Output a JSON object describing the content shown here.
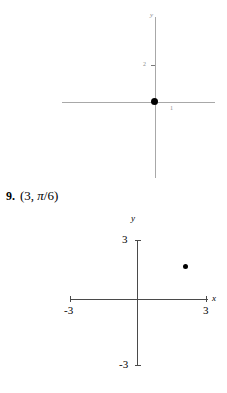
{
  "problem": {
    "number": "9.",
    "expression_open": "(",
    "radius": "3",
    "comma": ", ",
    "angle_numerator": "π",
    "angle_slash": "/",
    "angle_denominator": "6",
    "expression_close": ")",
    "full_text": "9. (3, π/6)"
  },
  "upper_graph": {
    "name": "partial-coordinate-plane",
    "y_axis_label": "y",
    "y_tick_label": "2",
    "x_tick_label": "1",
    "origin_point": {
      "label": "origin-dot",
      "x": "0",
      "y": "0"
    }
  },
  "lower_graph": {
    "name": "coordinate-plane",
    "x_axis_label": "x",
    "y_axis_label": "y",
    "ticks": {
      "y_top": "3",
      "y_bottom": "-3",
      "x_left": "-3",
      "x_right": "3"
    },
    "plotted_point": {
      "label": "plotted-point",
      "polar": "(3, π/6)",
      "x": "2.6",
      "y": "1.5"
    }
  },
  "colors": {
    "ink": "#000000",
    "axis_dark": "#4a4a4a",
    "axis_faint": "#a8a8a8",
    "label_faint": "#8d8d8d"
  },
  "chart_data": [
    {
      "type": "scatter",
      "title": "",
      "xlabel": "",
      "ylabel": "y",
      "xlim": [
        -2.5,
        2.5
      ],
      "ylim": [
        -2.5,
        4.0
      ],
      "grid": false,
      "legend": null,
      "xticks": [
        "1"
      ],
      "yticks": [
        "2"
      ],
      "x": [
        0
      ],
      "y": [
        0
      ],
      "annotations": [
        "origin dot"
      ]
    },
    {
      "type": "scatter",
      "title": "",
      "xlabel": "x",
      "ylabel": "y",
      "xlim": [
        -3,
        3
      ],
      "ylim": [
        -3,
        3
      ],
      "grid": false,
      "legend": null,
      "xticks": [
        "-3",
        "3"
      ],
      "yticks": [
        "-3",
        "3"
      ],
      "x": [
        2.6
      ],
      "y": [
        1.5
      ],
      "annotations": [
        "point at polar (3, π/6)"
      ]
    }
  ]
}
